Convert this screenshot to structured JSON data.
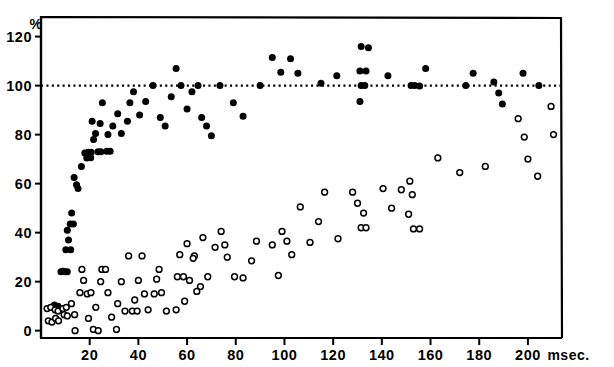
{
  "figure": {
    "name": "scatter-plot-percent-vs-msec",
    "background_color": "#ffffff",
    "ink_color": "#000000"
  },
  "axes": {
    "y_unit_label": "%",
    "x_unit_label": "msec.",
    "y_ticks": [
      0,
      20,
      40,
      60,
      80,
      100,
      120
    ],
    "x_ticks": [
      20,
      40,
      60,
      80,
      100,
      120,
      140,
      160,
      180,
      200
    ],
    "ylim": [
      -3,
      128
    ],
    "xlim": [
      0,
      214
    ],
    "frame": {
      "left_px": 41,
      "right_px": 562,
      "top_px": 17,
      "bottom_px": 338
    },
    "reference_line": {
      "value": 100,
      "style": "dotted",
      "label": "100%"
    }
  },
  "series_legend": [
    {
      "key": "filled",
      "marker": "filled-circle",
      "color": "#000000"
    },
    {
      "key": "open",
      "marker": "open-circle",
      "color": "#000000"
    }
  ],
  "chart_data": {
    "type": "scatter",
    "title": "",
    "xlabel": "msec.",
    "ylabel": "%",
    "xlim": [
      0,
      214
    ],
    "ylim": [
      -3,
      128
    ],
    "grid": false,
    "legend_position": "none",
    "annotations": [
      {
        "text": "%",
        "x_px": 33,
        "y_px": 24
      },
      {
        "text": "msec.",
        "x_px": 543,
        "y_px": 352
      }
    ],
    "reference_lines": [
      {
        "orientation": "horizontal",
        "y": 100,
        "style": "dotted"
      }
    ],
    "series": [
      {
        "name": "filled",
        "marker": "filled-circle",
        "color": "#000000",
        "points": [
          [
            5.5,
            10.5
          ],
          [
            7.0,
            10.0
          ],
          [
            8.2,
            24.0
          ],
          [
            9.0,
            24.2
          ],
          [
            10.0,
            24.0
          ],
          [
            10.8,
            24.0
          ],
          [
            10.2,
            33.0
          ],
          [
            12.2,
            33.0
          ],
          [
            11.3,
            37.0
          ],
          [
            10.8,
            41.0
          ],
          [
            12.0,
            43.5
          ],
          [
            13.3,
            43.5
          ],
          [
            12.6,
            48.0
          ],
          [
            13.6,
            62.5
          ],
          [
            14.6,
            59.5
          ],
          [
            15.2,
            58.0
          ],
          [
            16.6,
            67.0
          ],
          [
            18.0,
            72.5
          ],
          [
            19.4,
            72.8
          ],
          [
            20.6,
            72.8
          ],
          [
            18.8,
            70.5
          ],
          [
            20.4,
            70.6
          ],
          [
            23.4,
            73.0
          ],
          [
            24.6,
            73.0
          ],
          [
            27.0,
            73.2
          ],
          [
            28.4,
            73.2
          ],
          [
            21.6,
            78.0
          ],
          [
            22.4,
            80.5
          ],
          [
            24.3,
            84.5
          ],
          [
            21.0,
            85.5
          ],
          [
            25.2,
            93.0
          ],
          [
            27.5,
            80.0
          ],
          [
            29.5,
            83.5
          ],
          [
            31.5,
            88.5
          ],
          [
            33.0,
            80.5
          ],
          [
            35.5,
            85.5
          ],
          [
            36.5,
            93.0
          ],
          [
            38.0,
            97.5
          ],
          [
            40.5,
            88.0
          ],
          [
            43.0,
            93.5
          ],
          [
            46.0,
            100.0
          ],
          [
            49.0,
            87.0
          ],
          [
            51.0,
            83.5
          ],
          [
            53.5,
            95.5
          ],
          [
            55.5,
            107.0
          ],
          [
            57.5,
            100.0
          ],
          [
            60.0,
            90.5
          ],
          [
            62.0,
            97.5
          ],
          [
            64.5,
            100.0
          ],
          [
            66.0,
            87.0
          ],
          [
            68.0,
            83.5
          ],
          [
            70.0,
            79.5
          ],
          [
            73.5,
            100.0
          ],
          [
            79.0,
            93.0
          ],
          [
            83.0,
            87.5
          ],
          [
            90.0,
            100.0
          ],
          [
            95.0,
            111.5
          ],
          [
            98.5,
            105.5
          ],
          [
            102.5,
            111.0
          ],
          [
            105.5,
            105.0
          ],
          [
            115.0,
            101.0
          ],
          [
            121.5,
            104.0
          ],
          [
            131.5,
            116.0
          ],
          [
            134.5,
            115.5
          ],
          [
            131.0,
            106.0
          ],
          [
            133.5,
            106.0
          ],
          [
            131.5,
            100.0
          ],
          [
            133.0,
            100.0
          ],
          [
            131.0,
            93.5
          ],
          [
            142.5,
            104.0
          ],
          [
            152.0,
            100.0
          ],
          [
            153.5,
            100.0
          ],
          [
            155.5,
            99.8
          ],
          [
            158.0,
            107.0
          ],
          [
            174.5,
            100.0
          ],
          [
            177.5,
            105.0
          ],
          [
            186.0,
            101.5
          ],
          [
            188.0,
            97.0
          ],
          [
            189.5,
            92.5
          ],
          [
            198.0,
            105.0
          ],
          [
            204.5,
            100.0
          ]
        ]
      },
      {
        "name": "open",
        "marker": "open-circle",
        "color": "#000000",
        "points": [
          [
            2.5,
            9.0
          ],
          [
            4.0,
            9.5
          ],
          [
            3.0,
            4.0
          ],
          [
            4.5,
            3.5
          ],
          [
            6.0,
            5.0
          ],
          [
            7.2,
            4.0
          ],
          [
            5.8,
            8.5
          ],
          [
            7.0,
            8.0
          ],
          [
            9.5,
            6.5
          ],
          [
            10.8,
            6.0
          ],
          [
            9.0,
            9.0
          ],
          [
            10.4,
            9.5
          ],
          [
            12.5,
            11.0
          ],
          [
            14.0,
            0.0
          ],
          [
            16.0,
            15.5
          ],
          [
            13.8,
            6.5
          ],
          [
            17.5,
            20.5
          ],
          [
            16.8,
            25.0
          ],
          [
            19.0,
            15.0
          ],
          [
            20.5,
            15.5
          ],
          [
            19.5,
            5.0
          ],
          [
            21.5,
            0.5
          ],
          [
            23.5,
            0.0
          ],
          [
            22.5,
            9.5
          ],
          [
            25.0,
            25.0
          ],
          [
            26.5,
            25.0
          ],
          [
            24.5,
            20.0
          ],
          [
            27.5,
            15.5
          ],
          [
            29.0,
            5.5
          ],
          [
            31.0,
            0.5
          ],
          [
            33.0,
            20.0
          ],
          [
            31.5,
            11.0
          ],
          [
            34.5,
            8.0
          ],
          [
            36.0,
            30.5
          ],
          [
            37.5,
            8.0
          ],
          [
            39.5,
            8.0
          ],
          [
            41.5,
            30.5
          ],
          [
            40.0,
            20.5
          ],
          [
            38.5,
            12.5
          ],
          [
            42.5,
            15.0
          ],
          [
            44.0,
            8.5
          ],
          [
            47.5,
            21.0
          ],
          [
            48.5,
            25.0
          ],
          [
            46.5,
            15.0
          ],
          [
            49.5,
            15.5
          ],
          [
            51.5,
            8.0
          ],
          [
            55.5,
            8.5
          ],
          [
            57.0,
            31.0
          ],
          [
            60.0,
            35.5
          ],
          [
            63.0,
            30.5
          ],
          [
            65.5,
            18.0
          ],
          [
            56.0,
            22.0
          ],
          [
            58.5,
            22.0
          ],
          [
            62.5,
            29.5
          ],
          [
            66.5,
            38.0
          ],
          [
            61.0,
            20.5
          ],
          [
            64.0,
            16.0
          ],
          [
            59.0,
            12.0
          ],
          [
            68.5,
            22.0
          ],
          [
            71.5,
            34.0
          ],
          [
            74.0,
            40.5
          ],
          [
            75.5,
            35.0
          ],
          [
            76.5,
            30.0
          ],
          [
            79.5,
            22.0
          ],
          [
            83.0,
            21.5
          ],
          [
            86.5,
            28.5
          ],
          [
            88.5,
            36.5
          ],
          [
            95.0,
            35.0
          ],
          [
            99.0,
            40.5
          ],
          [
            97.5,
            22.5
          ],
          [
            101.0,
            36.5
          ],
          [
            103.0,
            31.0
          ],
          [
            106.5,
            50.5
          ],
          [
            110.5,
            36.0
          ],
          [
            114.0,
            44.5
          ],
          [
            116.5,
            56.5
          ],
          [
            122.0,
            37.5
          ],
          [
            128.0,
            56.5
          ],
          [
            130.0,
            52.0
          ],
          [
            132.5,
            48.0
          ],
          [
            131.5,
            42.0
          ],
          [
            133.5,
            42.0
          ],
          [
            140.5,
            58.0
          ],
          [
            144.0,
            50.0
          ],
          [
            148.0,
            57.5
          ],
          [
            151.5,
            61.0
          ],
          [
            152.5,
            55.5
          ],
          [
            151.0,
            47.5
          ],
          [
            153.0,
            41.5
          ],
          [
            155.5,
            41.5
          ],
          [
            163.0,
            70.5
          ],
          [
            172.0,
            64.5
          ],
          [
            182.5,
            67.0
          ],
          [
            196.0,
            86.5
          ],
          [
            198.5,
            79.0
          ],
          [
            200.0,
            70.0
          ],
          [
            204.0,
            63.0
          ],
          [
            209.5,
            91.5
          ],
          [
            210.5,
            80.0
          ]
        ]
      }
    ]
  }
}
